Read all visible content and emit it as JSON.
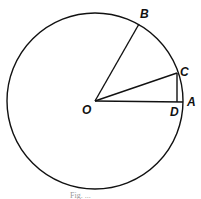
{
  "figure": {
    "caption": "Fig. ...",
    "stroke_color": "#111111",
    "circle": {
      "center_label": "O",
      "cx": 95,
      "cy": 101,
      "r": 88
    },
    "points": {
      "O": {
        "label": "O",
        "x": 95,
        "y": 101
      },
      "A": {
        "label": "A",
        "x": 183,
        "y": 102
      },
      "B": {
        "label": "B",
        "x": 139,
        "y": 24
      },
      "C": {
        "label": "C",
        "x": 177,
        "y": 73
      },
      "D": {
        "label": "D",
        "x": 177,
        "y": 102
      }
    },
    "segments": [
      {
        "from": "O",
        "to": "B"
      },
      {
        "from": "O",
        "to": "C"
      },
      {
        "from": "O",
        "to": "A"
      },
      {
        "from": "C",
        "to": "D"
      }
    ]
  }
}
